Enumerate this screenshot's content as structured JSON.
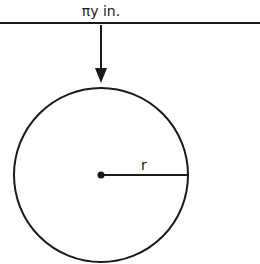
{
  "diagram": {
    "top_label": "πy in.",
    "radius_label": "r",
    "colors": {
      "stroke": "#1a1a1a",
      "background": "#ffffff"
    }
  }
}
